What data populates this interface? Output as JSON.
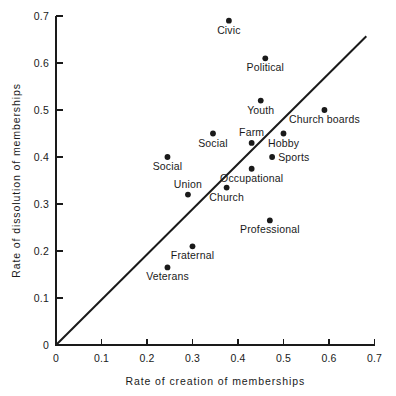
{
  "chart_data": {
    "type": "scatter",
    "title": "",
    "xlabel": "Rate of creation of memberships",
    "ylabel": "Rate of dissolution of memberships",
    "xlim": [
      0.0,
      0.7
    ],
    "ylim": [
      0.0,
      0.7
    ],
    "xticks": [
      "0",
      "0.1",
      "0.2",
      "0.3",
      "0.4",
      "0.5",
      "0.6",
      "0.7"
    ],
    "yticks": [
      "0",
      "0.1",
      "0.2",
      "0.3",
      "0.4",
      "0.5",
      "0.6",
      "0.7"
    ],
    "grid": false,
    "legend": "none",
    "annotations": [
      {
        "name": "identity-line",
        "kind": "line",
        "description": "45-degree reference line y = x",
        "x0": 0.0,
        "y0": 0.0,
        "x1": 0.682,
        "y1": 0.657
      }
    ],
    "points": [
      {
        "label": "Civic",
        "x": 0.38,
        "y": 0.69,
        "label_dx": 0,
        "label_dy": 13,
        "anchor": "middle"
      },
      {
        "label": "Political",
        "x": 0.46,
        "y": 0.61,
        "label_dx": 0,
        "label_dy": 13,
        "anchor": "middle"
      },
      {
        "label": "Youth",
        "x": 0.45,
        "y": 0.52,
        "label_dx": 0,
        "label_dy": 13,
        "anchor": "middle"
      },
      {
        "label": "Church boards",
        "x": 0.59,
        "y": 0.5,
        "label_dx": 0,
        "label_dy": 13,
        "anchor": "middle"
      },
      {
        "label": "Farm",
        "x": 0.43,
        "y": 0.43,
        "label_dx": 0,
        "label_dy": -7,
        "anchor": "middle"
      },
      {
        "label": "Hobby",
        "x": 0.5,
        "y": 0.45,
        "label_dx": 0,
        "label_dy": 13,
        "anchor": "middle"
      },
      {
        "label": "Social",
        "x": 0.345,
        "y": 0.45,
        "label_dx": 0,
        "label_dy": 13,
        "anchor": "middle"
      },
      {
        "label": "Social",
        "x": 0.245,
        "y": 0.4,
        "label_dx": 0,
        "label_dy": 13,
        "anchor": "middle"
      },
      {
        "label": "Sports",
        "x": 0.475,
        "y": 0.4,
        "label_dx": 6,
        "label_dy": 4,
        "anchor": "start"
      },
      {
        "label": "Occupational",
        "x": 0.43,
        "y": 0.375,
        "label_dx": 0,
        "label_dy": 13,
        "anchor": "middle"
      },
      {
        "label": "Church",
        "x": 0.375,
        "y": 0.335,
        "label_dx": 0,
        "label_dy": 13,
        "anchor": "middle"
      },
      {
        "label": "Union",
        "x": 0.29,
        "y": 0.32,
        "label_dx": 0,
        "label_dy": -7,
        "anchor": "middle"
      },
      {
        "label": "Professional",
        "x": 0.47,
        "y": 0.265,
        "label_dx": 0,
        "label_dy": 13,
        "anchor": "middle"
      },
      {
        "label": "Fraternal",
        "x": 0.3,
        "y": 0.21,
        "label_dx": 0,
        "label_dy": 13,
        "anchor": "middle"
      },
      {
        "label": "Veterans",
        "x": 0.245,
        "y": 0.165,
        "label_dx": 0,
        "label_dy": 13,
        "anchor": "middle"
      }
    ]
  },
  "figure": {
    "caption_ghost": "",
    "marker_color": "#1a1a1a",
    "axis_color": "#1a1a1a",
    "background": "#ffffff"
  }
}
